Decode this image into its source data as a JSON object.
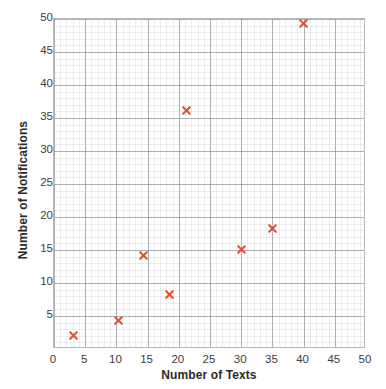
{
  "chart_data": {
    "type": "scatter",
    "title": "",
    "xlabel": "Number of Texts",
    "ylabel": "Number of Notifications",
    "xlim": [
      0,
      50
    ],
    "ylim": [
      0,
      50
    ],
    "xticks": [
      0,
      5,
      10,
      15,
      20,
      25,
      30,
      35,
      40,
      45,
      50
    ],
    "yticks": [
      5,
      10,
      15,
      20,
      25,
      30,
      35,
      40,
      45,
      50
    ],
    "grid": true,
    "minor_grid": true,
    "legend": "none",
    "marker": "x",
    "marker_color": "#E8502A",
    "points": [
      {
        "x": 3.2,
        "y": 2.0
      },
      {
        "x": 10.3,
        "y": 4.3
      },
      {
        "x": 14.3,
        "y": 14.2
      },
      {
        "x": 18.5,
        "y": 8.2
      },
      {
        "x": 21.3,
        "y": 36.2
      },
      {
        "x": 30.0,
        "y": 15.1
      },
      {
        "x": 35.0,
        "y": 18.3
      },
      {
        "x": 40.0,
        "y": 49.3
      }
    ]
  },
  "axes": {
    "x_tick_labels": [
      "0",
      "5",
      "10",
      "15",
      "20",
      "25",
      "30",
      "35",
      "40",
      "45",
      "50"
    ],
    "y_tick_labels": [
      "5",
      "10",
      "15",
      "20",
      "25",
      "30",
      "35",
      "40",
      "45",
      "50"
    ],
    "x_title": "Number of Texts",
    "y_title": "Number of Notifications"
  },
  "colors": {
    "marker": "#E8502A",
    "major_grid": "#7a7a82",
    "minor_grid": "#9696a0",
    "frame": "#b9b9b9",
    "text": "#3d3d3d",
    "background": "#ffffff"
  }
}
